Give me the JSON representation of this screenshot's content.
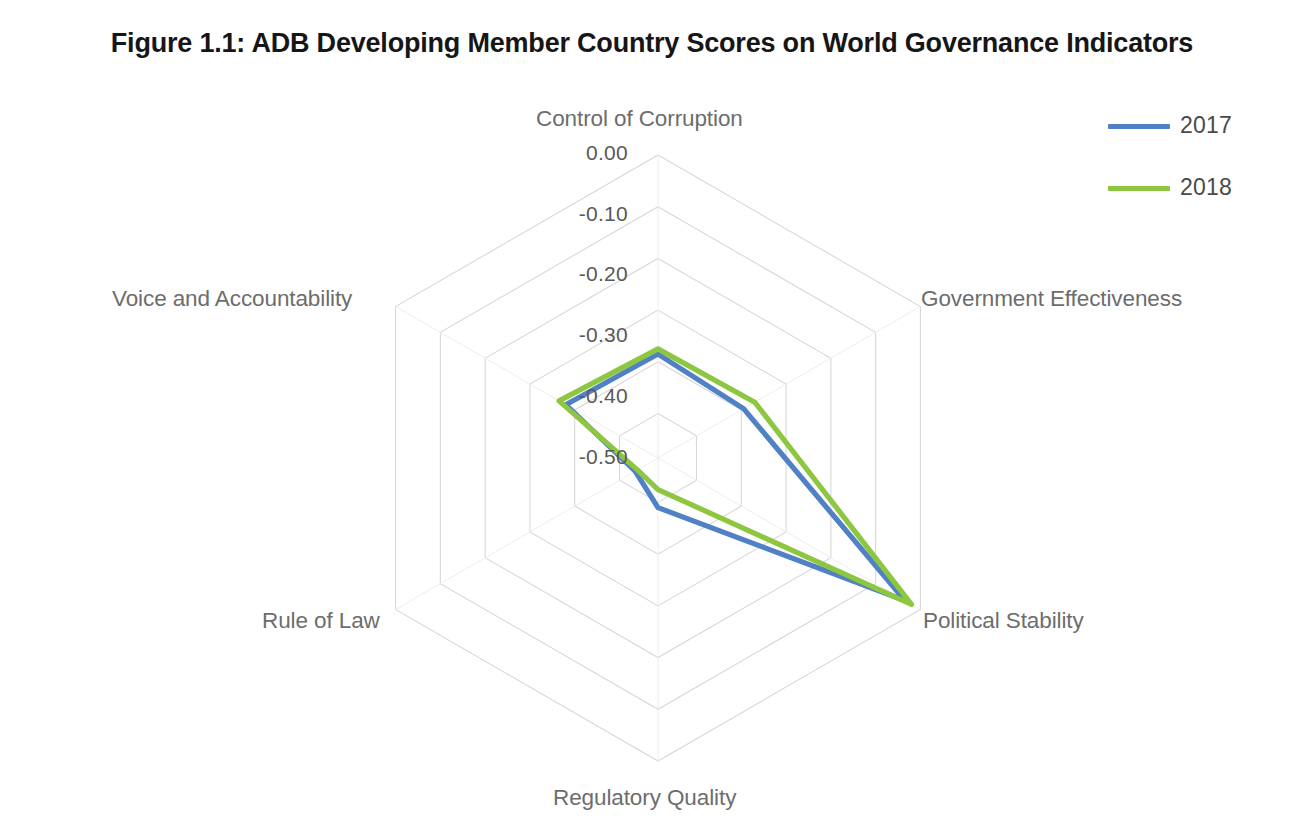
{
  "figure": {
    "title": "Figure 1.1: ADB Developing Member Country Scores on World Governance Indicators"
  },
  "legend": {
    "position": "top-right",
    "items": [
      {
        "label": "2017",
        "color": "#4f81c4"
      },
      {
        "label": "2018",
        "color": "#8dc63f"
      }
    ]
  },
  "axis_labels": {
    "control_of_corruption": "Control of Corruption",
    "government_effectiveness": "Government Effectiveness",
    "political_stability": "Political Stability",
    "regulatory_quality": "Regulatory Quality",
    "rule_of_law": "Rule of Law",
    "voice_and_accountability": "Voice and Accountability"
  },
  "tick_labels": {
    "t0": "0.00",
    "t1": "-0.10",
    "t2": "-0.20",
    "t3": "-0.30",
    "t4": "-0.40",
    "t5": "-0.50"
  },
  "chart_data": {
    "type": "radar",
    "title": "Figure 1.1: ADB Developing Member Country Scores on World Governance Indicators",
    "categories": [
      "Control of Corruption",
      "Government Effectiveness",
      "Political Stability",
      "Regulatory Quality",
      "Rule of Law",
      "Voice and Accountability"
    ],
    "series": [
      {
        "name": "2017",
        "color": "#4f81c4",
        "values": [
          -0.385,
          -0.395,
          -0.035,
          -0.49,
          -0.535,
          -0.38
        ]
      },
      {
        "name": "2018",
        "color": "#8dc63f",
        "values": [
          -0.375,
          -0.37,
          -0.02,
          -0.525,
          -0.54,
          -0.365
        ]
      }
    ],
    "ticks": [
      0.0,
      -0.1,
      -0.2,
      -0.3,
      -0.4,
      -0.5
    ],
    "tick_text": [
      "0.00",
      "-0.10",
      "-0.20",
      "-0.30",
      "-0.40",
      "-0.50"
    ],
    "rlim": [
      -0.586,
      0.0
    ],
    "grid": true,
    "grid_color": "#d8d8d8",
    "legend_position": "top-right",
    "xlabel": "",
    "ylabel": ""
  }
}
